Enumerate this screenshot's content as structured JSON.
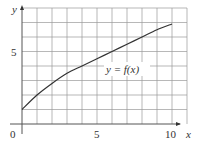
{
  "chart_data": {
    "type": "line",
    "title": "",
    "xlabel": "x",
    "ylabel": "y",
    "xlim": [
      0,
      10
    ],
    "ylim": [
      0,
      8
    ],
    "grid": true,
    "x_ticks": [
      "0",
      "5",
      "10"
    ],
    "y_ticks": [
      "5"
    ],
    "series": [
      {
        "name": "y = f(x)",
        "x": [
          0,
          1,
          2,
          3,
          4,
          5,
          6,
          7,
          8,
          9,
          10
        ],
        "values": [
          1,
          2.0,
          2.8,
          3.5,
          4.0,
          4.5,
          5.0,
          5.5,
          6.0,
          6.5,
          6.9
        ]
      }
    ],
    "annotations": [
      "y = f(x)"
    ]
  },
  "labels": {
    "x_axis": "x",
    "y_axis": "y",
    "origin": "0",
    "x_tick_5": "5",
    "x_tick_10": "10",
    "y_tick_5": "5",
    "curve": "y = f(x)"
  },
  "colors": {
    "grid": "#9a9a9a",
    "axis": "#555555",
    "curve": "#333333"
  }
}
